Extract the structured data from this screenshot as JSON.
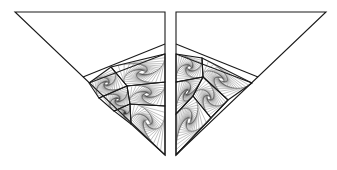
{
  "figure": {
    "stroke_color": "#1a1a1a",
    "thread_color": "#2b2b2b",
    "background": "#ffffff",
    "thread_steps": 18,
    "thread_ratio": 0.13
  },
  "panels": [
    {
      "name": "left-panel",
      "outline": [
        [
          15,
          12
        ],
        [
          165,
          12
        ],
        [
          165,
          155
        ]
      ],
      "dividers": [
        [
          [
            83,
            77
          ],
          [
            165,
            44
          ]
        ],
        [
          [
            89,
            83
          ],
          [
            165,
            54
          ]
        ]
      ],
      "whirls": [
        [
          [
            89,
            83
          ],
          [
            111,
            67
          ],
          [
            127,
            86
          ],
          [
            99,
            98
          ]
        ],
        [
          [
            111,
            67
          ],
          [
            165,
            54
          ],
          [
            165,
            82
          ],
          [
            127,
            86
          ]
        ],
        [
          [
            99,
            98
          ],
          [
            127,
            86
          ],
          [
            130,
            104
          ],
          [
            114,
            111
          ]
        ],
        [
          [
            127,
            86
          ],
          [
            165,
            82
          ],
          [
            165,
            106
          ],
          [
            130,
            104
          ]
        ],
        [
          [
            114,
            111
          ],
          [
            130,
            104
          ],
          [
            131,
            124
          ]
        ],
        [
          [
            130,
            104
          ],
          [
            165,
            106
          ],
          [
            165,
            155
          ],
          [
            131,
            124
          ]
        ]
      ]
    },
    {
      "name": "right-panel",
      "outline": [
        [
          176,
          12
        ],
        [
          326,
          12
        ],
        [
          176,
          155
        ]
      ],
      "dividers": [
        [
          [
            176,
            44
          ],
          [
            258,
            77
          ]
        ],
        [
          [
            176,
            54
          ],
          [
            252,
            83
          ]
        ]
      ],
      "whirls": [
        [
          [
            176,
            54
          ],
          [
            202,
            58
          ],
          [
            203,
            77
          ],
          [
            176,
            82
          ]
        ],
        [
          [
            202,
            58
          ],
          [
            252,
            83
          ],
          [
            228,
            100
          ],
          [
            203,
            77
          ]
        ],
        [
          [
            176,
            82
          ],
          [
            203,
            77
          ],
          [
            193,
            96
          ],
          [
            176,
            114
          ]
        ],
        [
          [
            203,
            77
          ],
          [
            228,
            100
          ],
          [
            211,
            118
          ],
          [
            193,
            96
          ]
        ],
        [
          [
            193,
            96
          ],
          [
            211,
            118
          ],
          [
            176,
            155
          ],
          [
            176,
            114
          ]
        ],
        [
          [
            211,
            118
          ],
          [
            228,
            100
          ],
          [
            176,
            155
          ]
        ]
      ]
    }
  ]
}
